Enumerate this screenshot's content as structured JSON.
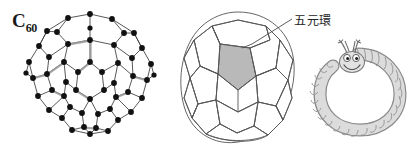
{
  "figure": {
    "background_color": "#ffffff",
    "width": 420,
    "height": 158,
    "panels": [
      {
        "id": "c60-ball-and-stick",
        "name": "C60 fullerene ball-and-stick model",
        "label_main": "C",
        "label_subscript": "60"
      },
      {
        "id": "truncated-icosahedron",
        "name": "Truncated icosahedron polyhedral cage",
        "highlight_face": "pentagon",
        "highlight_color": "#b9b9b9"
      },
      {
        "id": "nanotube-caterpillar",
        "name": "Cartoon carbon nanotube caterpillar",
        "body_color": "#d8d8d8"
      }
    ]
  },
  "labels": {
    "c60": {
      "text": "C",
      "subscript": "60"
    },
    "pentagon_ring": {
      "text": "五元環",
      "meaning_icon": "leader-line"
    }
  },
  "colors": {
    "stroke": "#3a3a3a",
    "vertex": "#111111",
    "pentagon_fill": "#b9b9b9",
    "caterpillar_fill": "#dcdcdc",
    "caterpillar_stroke": "#777777",
    "text": "#1a1a1a",
    "background": "#ffffff"
  }
}
